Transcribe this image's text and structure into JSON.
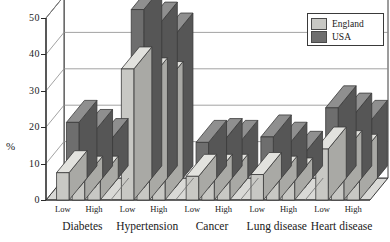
{
  "chart_data": {
    "type": "bar",
    "title": "",
    "subtitle": "",
    "xlabel": "",
    "ylabel": "%",
    "ylim": [
      0,
      50
    ],
    "yticks": [
      0,
      10,
      20,
      30,
      40,
      50
    ],
    "ytick_labels": [
      "0",
      "10",
      "20",
      "30",
      "40",
      "50"
    ],
    "grid": true,
    "projection": "3d-grouped-bars",
    "legend_position": "top-right",
    "categories": [
      "Diabetes",
      "Hypertension",
      "Cancer",
      "Lung disease",
      "Heart disease"
    ],
    "group_levels": [
      "Low",
      "",
      "High"
    ],
    "group_level_labels_visible": [
      "Low",
      "High"
    ],
    "legend": [
      "England",
      "USA"
    ],
    "series": [
      {
        "name": "England",
        "color": "#c8c8c4",
        "values": [
          [
            7.5,
            6.0,
            6.0
          ],
          [
            36.0,
            33.0,
            32.0
          ],
          [
            6.5,
            6.5,
            6.5
          ],
          [
            7.0,
            6.0,
            5.5
          ],
          [
            14.0,
            13.0,
            12.0
          ]
        ]
      },
      {
        "name": "USA",
        "color": "#6e6e6e",
        "values": [
          [
            18.0,
            15.5,
            13.0
          ],
          [
            49.0,
            45.0,
            42.0
          ],
          [
            12.5,
            13.0,
            12.5
          ],
          [
            14.0,
            12.0,
            9.5
          ],
          [
            22.0,
            20.0,
            18.0
          ]
        ]
      }
    ]
  },
  "legend": {
    "items": [
      {
        "label": "England",
        "color": "#c8c8c4"
      },
      {
        "label": "USA",
        "color": "#6e6e6e"
      }
    ]
  },
  "axes": {
    "y_axis_title": "%",
    "y_tick_labels": [
      "0",
      "10",
      "20",
      "30",
      "40",
      "50"
    ]
  },
  "colors": {
    "england_face": "#c8c8c4",
    "england_top": "#e2e2de",
    "england_side": "#a9a9a5",
    "usa_face": "#6e6e6e",
    "usa_top": "#8f8f8f",
    "usa_side": "#565656",
    "wall": "#ffffff",
    "floor": "#d9d9d6",
    "outline": "#3a3a3a",
    "grid": "#8a8a8a"
  }
}
